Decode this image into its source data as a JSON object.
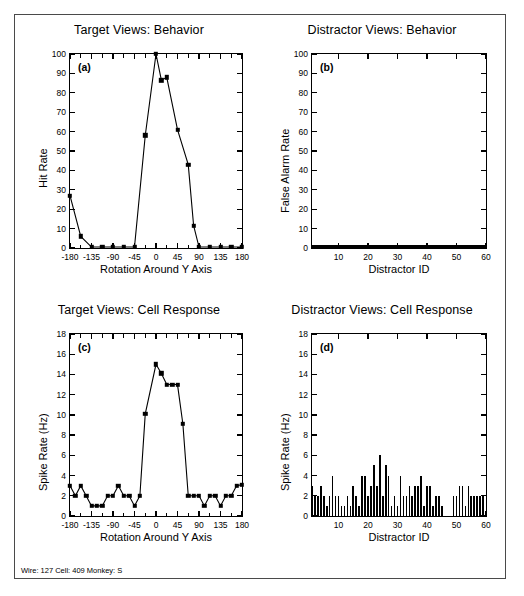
{
  "figure": {
    "footer_note": "Wire: 127 Cell: 409 Monkey: S",
    "panels": [
      {
        "letter": "(a)",
        "title": "Target Views: Behavior",
        "xlabel": "Rotation Around Y Axis",
        "ylabel": "Hit Rate"
      },
      {
        "letter": "(b)",
        "title": "Distractor Views: Behavior",
        "xlabel": "Distractor ID",
        "ylabel": "False Alarm Rate"
      },
      {
        "letter": "(c)",
        "title": "Target Views: Cell Response",
        "xlabel": "Rotation Around Y Axis",
        "ylabel": "Spike Rate (Hz)"
      },
      {
        "letter": "(d)",
        "title": "Distractor Views: Cell Response",
        "xlabel": "Distractor ID",
        "ylabel": "Spike Rate (Hz)"
      }
    ]
  },
  "chart_data": [
    {
      "panel": "a",
      "type": "line",
      "title": "Target Views: Behavior",
      "xlabel": "Rotation Around Y Axis",
      "ylabel": "Hit Rate",
      "xlim": [
        -180,
        180
      ],
      "ylim": [
        0,
        100
      ],
      "xticks": [
        -180,
        -135,
        -90,
        -45,
        0,
        45,
        90,
        135,
        180
      ],
      "xtick_labels": [
        "-180",
        "-135",
        "-90",
        "-45",
        "0",
        "45",
        "90",
        "135",
        "180"
      ],
      "yticks": [
        0,
        10,
        20,
        30,
        40,
        50,
        60,
        70,
        80,
        90,
        100
      ],
      "grid": false,
      "legend": "none",
      "marker": "filled-square",
      "x": [
        -180,
        -157.5,
        -135,
        -112.5,
        -90,
        -67.5,
        -45,
        -22.5,
        0,
        11.25,
        22.5,
        45,
        67.5,
        78.75,
        90,
        112.5,
        135,
        157.5,
        180
      ],
      "y": [
        27,
        6,
        0.5,
        0.5,
        0.5,
        0.5,
        0.5,
        58,
        100,
        86.5,
        88,
        61,
        43,
        11.5,
        0.5,
        0.5,
        0.5,
        0.5,
        0.5
      ]
    },
    {
      "panel": "b",
      "type": "bar",
      "title": "Distractor Views: Behavior",
      "xlabel": "Distractor ID",
      "ylabel": "False Alarm Rate",
      "xlim": [
        1,
        60
      ],
      "ylim": [
        0,
        100
      ],
      "xticks": [
        10,
        20,
        30,
        40,
        50,
        60
      ],
      "xtick_labels": [
        "10",
        "20",
        "30",
        "40",
        "50",
        "60"
      ],
      "yticks": [
        0,
        10,
        20,
        30,
        40,
        50,
        60,
        70,
        80,
        90,
        100
      ],
      "grid": false,
      "legend": "none",
      "categories": [
        1,
        2,
        3,
        4,
        5,
        6,
        7,
        8,
        9,
        10,
        11,
        12,
        13,
        14,
        15,
        16,
        17,
        18,
        19,
        20,
        21,
        22,
        23,
        24,
        25,
        26,
        27,
        28,
        29,
        30,
        31,
        32,
        33,
        34,
        35,
        36,
        37,
        38,
        39,
        40,
        41,
        42,
        43,
        44,
        45,
        46,
        47,
        48,
        49,
        50,
        51,
        52,
        53,
        54,
        55,
        56,
        57,
        58,
        59,
        60
      ],
      "values": [
        0,
        0,
        0,
        0,
        0,
        0,
        0,
        0,
        0,
        0,
        0,
        0,
        0,
        0,
        0,
        0,
        0,
        0,
        0,
        0,
        0,
        0,
        0,
        0,
        0,
        0,
        0,
        0,
        0,
        0,
        0,
        0,
        0,
        0,
        0,
        0,
        0,
        0,
        0,
        0,
        0,
        0,
        0,
        0,
        0,
        0,
        0,
        0,
        0,
        0,
        0,
        0,
        0,
        0,
        0,
        0,
        0,
        0,
        0,
        0
      ]
    },
    {
      "panel": "c",
      "type": "line",
      "title": "Target Views: Cell Response",
      "xlabel": "Rotation Around Y Axis",
      "ylabel": "Spike Rate (Hz)",
      "xlim": [
        -180,
        180
      ],
      "ylim": [
        0,
        18
      ],
      "xticks": [
        -180,
        -135,
        -90,
        -45,
        0,
        45,
        90,
        135,
        180
      ],
      "xtick_labels": [
        "-180",
        "-135",
        "-90",
        "-45",
        "0",
        "45",
        "90",
        "135",
        "180"
      ],
      "yticks": [
        0,
        2,
        4,
        6,
        8,
        10,
        12,
        14,
        16,
        18
      ],
      "grid": false,
      "legend": "none",
      "marker": "filled-square",
      "x": [
        -180,
        -168.75,
        -157.5,
        -146.25,
        -135,
        -123.75,
        -112.5,
        -101.25,
        -90,
        -78.75,
        -67.5,
        -56.25,
        -45,
        -33.75,
        -22.5,
        0,
        11.25,
        22.5,
        33.75,
        45,
        56.25,
        67.5,
        78.75,
        90,
        101.25,
        112.5,
        123.75,
        135,
        146.25,
        157.5,
        168.75,
        180
      ],
      "y": [
        3,
        2,
        3,
        2,
        1,
        1,
        1,
        2,
        2,
        3,
        2,
        2,
        1,
        2,
        10.1,
        15,
        14.1,
        13,
        13,
        13,
        9.1,
        2,
        2,
        2,
        1,
        2,
        2,
        1,
        2,
        2,
        3,
        3.1
      ]
    },
    {
      "panel": "d",
      "type": "bar",
      "title": "Distractor Views: Cell Response",
      "xlabel": "Distractor ID",
      "ylabel": "Spike Rate (Hz)",
      "xlim": [
        1,
        60
      ],
      "ylim": [
        0,
        18
      ],
      "xticks": [
        10,
        20,
        30,
        40,
        50,
        60
      ],
      "xtick_labels": [
        "10",
        "20",
        "30",
        "40",
        "50",
        "60"
      ],
      "yticks": [
        0,
        2,
        4,
        6,
        8,
        10,
        12,
        14,
        16,
        18
      ],
      "grid": false,
      "legend": "none",
      "categories": [
        1,
        2,
        3,
        4,
        5,
        6,
        7,
        8,
        9,
        10,
        11,
        12,
        13,
        14,
        15,
        16,
        17,
        18,
        19,
        20,
        21,
        22,
        23,
        24,
        25,
        26,
        27,
        28,
        29,
        30,
        31,
        32,
        33,
        34,
        35,
        36,
        37,
        38,
        39,
        40,
        41,
        42,
        43,
        44,
        45,
        46,
        47,
        48,
        49,
        50,
        51,
        52,
        53,
        54,
        55,
        56,
        57,
        58,
        59,
        60
      ],
      "values": [
        3,
        2,
        2,
        3,
        2,
        1,
        2,
        4,
        2,
        2,
        1,
        1,
        2,
        1,
        3,
        2,
        1,
        4,
        4,
        2,
        3,
        5,
        3,
        6,
        2,
        5,
        4,
        1,
        2,
        1,
        4,
        2,
        2,
        3,
        2,
        3,
        3,
        4,
        1,
        3,
        3,
        1,
        2,
        2,
        1,
        0,
        0,
        0,
        2,
        2,
        3,
        3,
        1,
        3,
        2,
        2,
        2,
        2,
        2,
        0
      ]
    }
  ]
}
